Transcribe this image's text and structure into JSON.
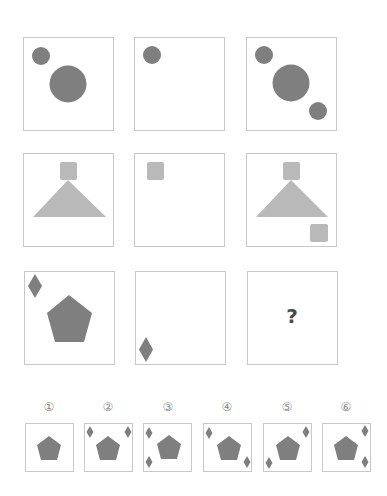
{
  "puzzle": {
    "question_mark": "?",
    "colors": {
      "dark_shape": "#7f7f7f",
      "light_shape": "#b9b9b9",
      "border": "#c8c8c8"
    },
    "grid": [
      {
        "row": 1,
        "cells": [
          "small circle top-left + large circle center",
          "small circle top-left",
          "small circle top-left + large circle center + small circle bottom-right"
        ]
      },
      {
        "row": 2,
        "cells": [
          "square on top of triangle",
          "square top-left",
          "square on top of triangle + square bottom-right"
        ]
      },
      {
        "row": 3,
        "cells": [
          "diamond top-left + pentagon center",
          "diamond bottom-left",
          "?"
        ]
      }
    ],
    "options": [
      {
        "label": "①",
        "description": "pentagon only"
      },
      {
        "label": "②",
        "description": "pentagon + diamonds top-left and top-right"
      },
      {
        "label": "③",
        "description": "pentagon + diamonds top-left and bottom-left"
      },
      {
        "label": "④",
        "description": "pentagon + diamonds top-left and bottom-right"
      },
      {
        "label": "⑤",
        "description": "pentagon + diamonds top-right and bottom-left"
      },
      {
        "label": "⑥",
        "description": "pentagon + diamonds top-right and bottom-right"
      }
    ]
  }
}
